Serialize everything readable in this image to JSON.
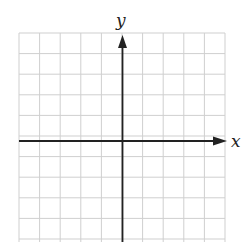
{
  "diagram": {
    "type": "coordinate-plane",
    "x_axis_label": "x",
    "y_axis_label": "y",
    "grid": {
      "columns": 10,
      "rows_visible": 10,
      "cell_size_px": 20.6,
      "line_color": "#cfcfcf"
    },
    "axis_color": "#222222",
    "origin_px": {
      "x": 122,
      "y": 141
    }
  }
}
